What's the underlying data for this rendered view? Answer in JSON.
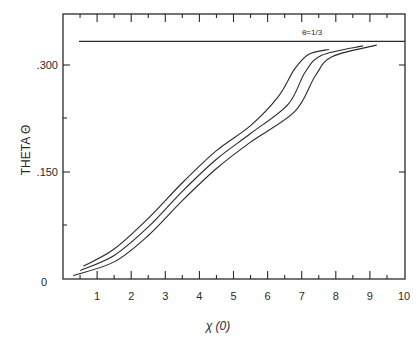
{
  "chart_data": {
    "type": "line",
    "title": "",
    "xlabel": "χ (0)",
    "ylabel": "THETA Θ",
    "xlim": [
      0,
      10
    ],
    "ylim": [
      0,
      0.37
    ],
    "x_ticks": [
      "1",
      "2",
      "3",
      "4",
      "5",
      "6",
      "7",
      "8",
      "9",
      "10"
    ],
    "y_ticks": [
      {
        "value": 0,
        "label": "0"
      },
      {
        "value": 0.15,
        "label": ".150"
      },
      {
        "value": 0.3,
        "label": ".300"
      }
    ],
    "grid": false,
    "legend": null,
    "reference_line": {
      "y": 0.3333,
      "label": "θ=1/3"
    },
    "series": [
      {
        "name": "curve-1",
        "x": [
          0.6,
          1.5,
          2.5,
          3.5,
          4.5,
          5.5,
          6.3,
          6.8,
          7.2,
          7.8
        ],
        "y": [
          0.018,
          0.042,
          0.085,
          0.135,
          0.18,
          0.215,
          0.255,
          0.295,
          0.315,
          0.322
        ]
      },
      {
        "name": "curve-2",
        "x": [
          0.5,
          1.5,
          2.5,
          3.5,
          4.5,
          5.5,
          6.6,
          7.1,
          7.6,
          8.8
        ],
        "y": [
          0.012,
          0.033,
          0.073,
          0.123,
          0.168,
          0.204,
          0.245,
          0.29,
          0.314,
          0.327
        ]
      },
      {
        "name": "curve-3",
        "x": [
          0.3,
          1.5,
          2.5,
          3.5,
          4.5,
          5.5,
          6.8,
          7.4,
          7.9,
          9.2
        ],
        "y": [
          0.005,
          0.024,
          0.061,
          0.11,
          0.155,
          0.192,
          0.235,
          0.285,
          0.312,
          0.328
        ]
      }
    ]
  },
  "labels": {
    "xlabel": "χ (0)",
    "ylabel": "THETA Θ",
    "annotation": "θ=1/3",
    "y_ticks": {
      "zero": "0",
      "mid": ".150",
      "top": ".300"
    },
    "x_ticks": [
      "1",
      "2",
      "3",
      "4",
      "5",
      "6",
      "7",
      "8",
      "9",
      "10"
    ]
  },
  "colors": {
    "ink": "#2a2a2a",
    "background": "#ffffff"
  }
}
